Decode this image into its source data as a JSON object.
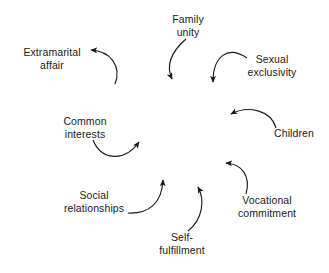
{
  "diagram": {
    "background_color": "#ffffff",
    "stroke_color": "#1a1a1a",
    "text_color": "#1a1a1a",
    "nodes": [
      {
        "id": "family-unity",
        "label": "Family\nunity",
        "x": 188,
        "y": 25
      },
      {
        "id": "sexual-exclusivity",
        "label": "Sexual\nexclusivity",
        "x": 272,
        "y": 65
      },
      {
        "id": "children",
        "label": "Children",
        "x": 294,
        "y": 133
      },
      {
        "id": "vocational-commitment",
        "label": "Vocational\ncommitment",
        "x": 267,
        "y": 206
      },
      {
        "id": "self-fulfillment",
        "label": "Self-\nfulfillment",
        "x": 182,
        "y": 243
      },
      {
        "id": "social-relationships",
        "label": "Social\nrelationships",
        "x": 94,
        "y": 201
      },
      {
        "id": "common-interests",
        "label": "Common\ninterests",
        "x": 85,
        "y": 127
      },
      {
        "id": "extramarital-affair",
        "label": "Extramarital\naffair",
        "x": 52,
        "y": 58
      }
    ],
    "arrows": [
      {
        "id": "arrow-family-unity-to-center",
        "from": "family-unity",
        "to": "center",
        "path": "M 186 39 C 171 52 166 66 172 79"
      },
      {
        "id": "arrow-sexual-exclusivity-to-center",
        "from": "sexual-exclusivity",
        "to": "center",
        "path": "M 247 58 C 228 45 213 56 213 82"
      },
      {
        "id": "arrow-children-to-center",
        "from": "children",
        "to": "center",
        "path": "M 276 128 C 271 110 248 105 231 114"
      },
      {
        "id": "arrow-vocational-to-children",
        "from": "vocational-commitment",
        "to": "children",
        "path": "M 246 194 C 251 176 242 164 226 163"
      },
      {
        "id": "arrow-self-fulfillment-to-vocational",
        "from": "self-fulfillment",
        "to": "vocational-commitment",
        "path": "M 188 231 C 203 219 205 200 198 187"
      },
      {
        "id": "arrow-social-relationships-to-center",
        "from": "social-relationships",
        "to": "center",
        "path": "M 128 213 C 148 214 162 204 163 180"
      },
      {
        "id": "arrow-common-interests-to-social",
        "from": "common-interests",
        "to": "social-relationships",
        "path": "M 93 140 C 101 160 124 163 139 142"
      },
      {
        "id": "arrow-center-to-extramarital-affair",
        "from": "center",
        "to": "extramarital-affair",
        "path": "M 115 84 C 122 66 110 51 91 50"
      }
    ]
  }
}
